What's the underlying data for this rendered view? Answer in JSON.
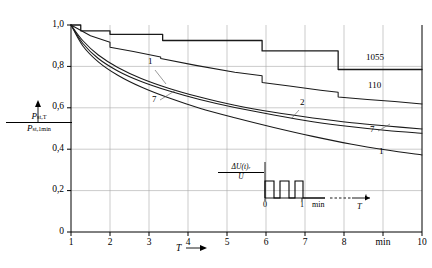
{
  "chart_data": {
    "type": "line",
    "title": "",
    "xlabel": "T",
    "ylabel": "P st,T / P st,1min",
    "xunit": "min",
    "xlim": [
      1,
      10
    ],
    "ylim": [
      0,
      1
    ],
    "grid": true,
    "legend_position": "inline-curve-labels",
    "x_ticks": [
      "1",
      "2",
      "3",
      "4",
      "5",
      "6",
      "7",
      "8",
      "min",
      "10"
    ],
    "x_tick_values": [
      1,
      2,
      3,
      4,
      5,
      6,
      7,
      8,
      9,
      10
    ],
    "y_ticks": [
      "0",
      "0,2",
      "0,4",
      "0,6",
      "0,8",
      "1,0"
    ],
    "y_tick_values": [
      0,
      0.2,
      0.4,
      0.6,
      0.8,
      1.0
    ],
    "series": [
      {
        "name": "1055",
        "label": "1055",
        "style": "step",
        "x": [
          1,
          1.25,
          1.25,
          2.0,
          2.0,
          3.35,
          3.35,
          5.9,
          5.9,
          7.85,
          7.85,
          10
        ],
        "y": [
          1.0,
          1.0,
          0.972,
          0.972,
          0.955,
          0.955,
          0.925,
          0.925,
          0.875,
          0.875,
          0.785,
          0.785
        ]
      },
      {
        "name": "110",
        "label": "110",
        "style": "step-decay",
        "x": [
          1,
          1.5,
          2.0,
          2.0,
          2.6,
          3.3,
          3.3,
          4.2,
          5.2,
          5.9,
          5.9,
          6.6,
          7.4,
          7.85,
          7.85,
          8.6,
          9.3,
          10
        ],
        "y": [
          1.0,
          0.948,
          0.917,
          0.893,
          0.872,
          0.845,
          0.838,
          0.805,
          0.772,
          0.755,
          0.722,
          0.705,
          0.685,
          0.675,
          0.652,
          0.64,
          0.63,
          0.618
        ]
      },
      {
        "name": "2",
        "label": "2",
        "style": "smooth",
        "x": [
          1,
          1.3,
          1.7,
          2.2,
          2.8,
          3.5,
          4.3,
          5.2,
          6.2,
          7.2,
          8.2,
          9.1,
          10
        ],
        "y": [
          1.0,
          0.925,
          0.855,
          0.795,
          0.742,
          0.695,
          0.652,
          0.612,
          0.578,
          0.551,
          0.528,
          0.512,
          0.498
        ]
      },
      {
        "name": "7",
        "label": "7",
        "style": "smooth",
        "x": [
          1,
          1.3,
          1.7,
          2.2,
          2.8,
          3.5,
          4.3,
          5.2,
          6.2,
          7.2,
          8.2,
          9.1,
          10
        ],
        "y": [
          1.0,
          0.912,
          0.838,
          0.778,
          0.727,
          0.682,
          0.64,
          0.601,
          0.565,
          0.533,
          0.508,
          0.49,
          0.477
        ]
      },
      {
        "name": "1",
        "label": "1",
        "style": "smooth",
        "x": [
          1,
          1.3,
          1.7,
          2.2,
          2.8,
          3.5,
          4.3,
          5.2,
          6.2,
          7.2,
          8.2,
          9.1,
          10
        ],
        "y": [
          1.0,
          0.9,
          0.822,
          0.757,
          0.7,
          0.648,
          0.598,
          0.552,
          0.505,
          0.462,
          0.424,
          0.396,
          0.372
        ]
      }
    ],
    "curve_callouts": [
      {
        "label": "1",
        "x_px": 148,
        "y_px": 62,
        "leader": [
          155,
          70,
          166,
          84
        ]
      },
      {
        "label": "7",
        "x_px": 152,
        "y_px": 100,
        "leader": [
          160,
          100,
          176,
          90
        ]
      },
      {
        "label": "2",
        "x_px": 300,
        "y_px": 103,
        "leader": [
          299,
          110,
          291,
          119
        ]
      },
      {
        "label": "1055",
        "x_px": 366,
        "y_px": 58,
        "leader": null
      },
      {
        "label": "110",
        "x_px": 368,
        "y_px": 86,
        "leader": null
      },
      {
        "label": "7",
        "x_px": 370,
        "y_px": 130,
        "leader": [
          378,
          131,
          390,
          124
        ]
      },
      {
        "label": "1",
        "x_px": 379,
        "y_px": 152,
        "leader": null
      }
    ],
    "annotations": [
      "Curves labelled 1055, 110, 2, 7 and 1 show relative short-term flicker severity versus observation time T"
    ]
  },
  "axes": {
    "y_label_numerator": "P",
    "y_label_numerator_sub": "st,T",
    "y_label_denominator": "P",
    "y_label_denominator_sub": "st,1min",
    "x_label": "T",
    "x_arrow": "→"
  },
  "inset": {
    "name": "voltage-fluctuation-waveform",
    "y_label_numerator": "ΔU(t)",
    "y_label_numerator_sub": "r",
    "y_label_denominator": "U",
    "tick_0": "0",
    "tick_1": "1",
    "unit": "min",
    "axis_label": "T",
    "pulse_count": 3
  },
  "colors": {
    "background": "#ffffff",
    "curve": "#1a1a1a",
    "grid": "#a8a8a8",
    "axis": "#000000"
  }
}
